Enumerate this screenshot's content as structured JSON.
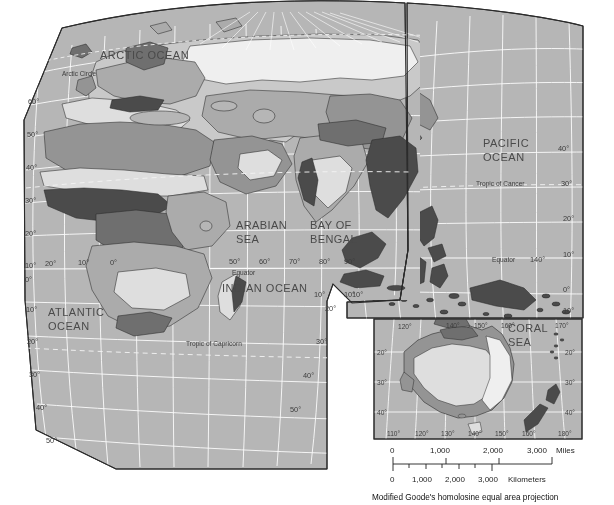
{
  "map": {
    "projection_caption": "Modified Goode's homolosine equal area projection",
    "ocean_labels": [
      {
        "id": "arctic",
        "text": "ARCTIC OCEAN"
      },
      {
        "id": "atlantic_1",
        "text": "ATLANTIC"
      },
      {
        "id": "atlantic_2",
        "text": "OCEAN"
      },
      {
        "id": "indian",
        "text": "INDIAN OCEAN"
      },
      {
        "id": "pacific_1",
        "text": "PACIFIC"
      },
      {
        "id": "pacific_2",
        "text": "OCEAN"
      }
    ],
    "sea_labels": [
      {
        "id": "arabian_1",
        "text": "ARABIAN"
      },
      {
        "id": "arabian_2",
        "text": "SEA"
      },
      {
        "id": "bengal_1",
        "text": "BAY OF"
      },
      {
        "id": "bengal_2",
        "text": "BENGAL"
      },
      {
        "id": "coral_1",
        "text": "CORAL"
      },
      {
        "id": "coral_2",
        "text": "SEA"
      }
    ],
    "reference_lines": [
      {
        "id": "arctic-circle",
        "text": "Arctic Circle"
      },
      {
        "id": "tropic-cancer",
        "text": "Tropic of Cancer"
      },
      {
        "id": "equator-left",
        "text": "Equator"
      },
      {
        "id": "equator-right",
        "text": "Equator"
      },
      {
        "id": "tropic-capricorn",
        "text": "Tropic of Capricorn"
      }
    ],
    "latitude_left": [
      "60°",
      "50°",
      "40°",
      "30°",
      "20°",
      "10°",
      "0°",
      "10°",
      "20°",
      "30°",
      "40°",
      "50°"
    ],
    "latitude_right_main": [
      "10°",
      "20°",
      "30°",
      "40°",
      "50°"
    ],
    "latitude_pacific": [
      "40°",
      "30°",
      "20°",
      "10°",
      "0°",
      "10°"
    ],
    "longitude_equator_west": [
      "20°",
      "10°",
      "0°"
    ],
    "longitude_equator_east": [
      "50°",
      "60°",
      "70°",
      "80°",
      "90°"
    ],
    "longitude_pacific": [
      "140°"
    ],
    "split_labels": [
      "10°",
      "10°"
    ]
  },
  "inset": {
    "name": "Australia and New Zealand inset",
    "longitude_top": [
      "120°",
      "140°",
      "150°",
      "160°",
      "170°"
    ],
    "longitude_bottom": [
      "110°",
      "120°",
      "130°",
      "140°",
      "150°",
      "160°",
      "180°"
    ],
    "latitude_left": [
      "20°",
      "30°",
      "40°"
    ],
    "latitude_right": [
      "20°",
      "30°",
      "40°"
    ]
  },
  "scale": {
    "miles_ticks": [
      "0",
      "1,000",
      "2,000",
      "3,000"
    ],
    "miles_unit": "Miles",
    "km_ticks": [
      "0",
      "1,000",
      "2,000",
      "3,000"
    ],
    "km_unit": "Kilometers"
  },
  "palette": {
    "ocean": "#b6b6b6",
    "graticule": "#ffffff",
    "outline": "#2b2b2b",
    "land_lightest": "#efefef",
    "land_light": "#dedede",
    "land_mid_light": "#c9c9c9",
    "land_mid": "#ababab",
    "land_mid_dark": "#949494",
    "land_dark": "#6f6f6f",
    "land_darkest": "#4b4b4b",
    "paper": "#ffffff"
  }
}
